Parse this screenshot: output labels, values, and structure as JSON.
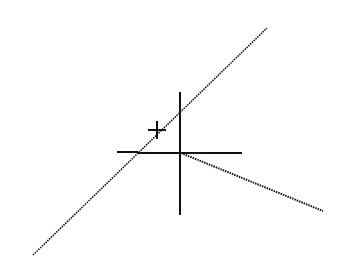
{
  "canvas": {
    "width": 343,
    "height": 278,
    "background": "#ffffff",
    "stroke": "#111111"
  },
  "lines": [
    {
      "name": "diagonal-line",
      "x1": 33,
      "y1": 255,
      "x2": 267,
      "y2": 28,
      "dashed": true
    },
    {
      "name": "tracking-line",
      "x1": 181,
      "y1": 153,
      "x2": 323,
      "y2": 211,
      "dashed": true
    }
  ],
  "crosshair": {
    "cx": 180,
    "cy": 153,
    "horizontal": {
      "x1": 138,
      "x2": 242
    },
    "vertical": {
      "y1": 92,
      "y2": 215
    },
    "snap_marker": {
      "x1": 117,
      "x2": 138,
      "y": 152
    },
    "vertical_tick": {
      "x": 180,
      "y1": 112,
      "y2": 130
    }
  },
  "cursor_plus": {
    "cx": 157,
    "cy": 130,
    "size": 9
  }
}
